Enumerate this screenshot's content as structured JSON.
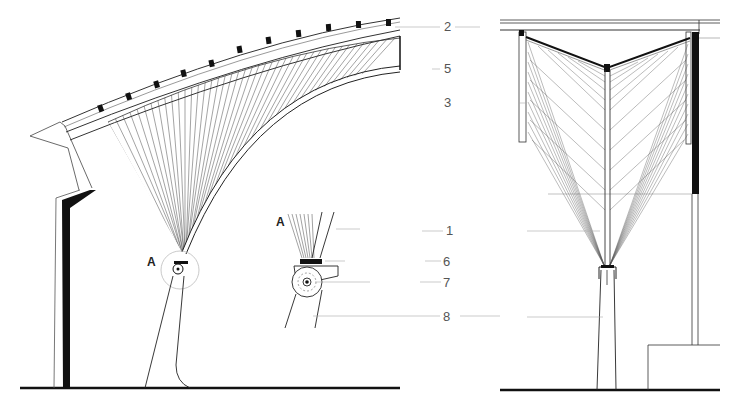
{
  "drawing": {
    "type": "architectural-section",
    "views": [
      "side-section",
      "front-section"
    ],
    "callouts": [
      {
        "id": "2",
        "label": "2"
      },
      {
        "id": "5",
        "label": "5"
      },
      {
        "id": "3",
        "label": "3"
      },
      {
        "id": "1",
        "label": "1"
      },
      {
        "id": "6",
        "label": "6"
      },
      {
        "id": "7",
        "label": "7"
      },
      {
        "id": "8",
        "label": "8"
      }
    ],
    "detail_markers": [
      {
        "id": "A-main",
        "label": "A"
      },
      {
        "id": "A-detail",
        "label": "A"
      }
    ],
    "colors": {
      "ink": "#111111",
      "thin_line": "#444444",
      "leader": "#999999",
      "background": "#ffffff"
    }
  }
}
